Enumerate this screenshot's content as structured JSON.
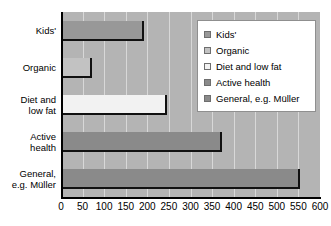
{
  "chart_data": {
    "type": "bar",
    "orientation": "horizontal",
    "title": "",
    "xlabel": "",
    "ylabel": "",
    "categories": [
      "Kids'",
      "Diet and low fat",
      "Organic",
      "Active health",
      "General, e.g. Müller"
    ],
    "axis_categories": [
      "Kids'",
      "Organic",
      "Diet and low fat",
      "Active health",
      "General, e.g. Müller"
    ],
    "values": [
      193,
      72,
      246,
      372,
      553
    ],
    "xlim": [
      0,
      600
    ],
    "xticks": [
      0,
      50,
      100,
      150,
      200,
      250,
      300,
      350,
      400,
      450,
      500,
      550,
      600
    ],
    "xtick_labels": [
      "0",
      "50",
      "100",
      "150",
      "200",
      "250",
      "300",
      "350",
      "400",
      "450",
      "500",
      "550",
      "600"
    ],
    "grid": true,
    "legend_position": "top-right",
    "bars": [
      {
        "label": "Kids'",
        "label_lines": "Kids'",
        "value": 193,
        "color": "#989898"
      },
      {
        "label": "Organic",
        "label_lines": "Organic",
        "value": 72,
        "color": "#c2c2c2"
      },
      {
        "label": "Diet and low fat",
        "label_lines": "Diet and\nlow fat",
        "value": 246,
        "color": "#f2f2f2"
      },
      {
        "label": "Active health",
        "label_lines": "Active\nhealth",
        "value": 372,
        "color": "#8a8a8a"
      },
      {
        "label": "General, e.g. Müller",
        "label_lines": "General,\ne.g. Müller",
        "value": 553,
        "color": "#8a8a8a"
      }
    ],
    "legend": [
      {
        "label": "Kids'",
        "color": "#989898"
      },
      {
        "label": "Organic",
        "color": "#c2c2c2"
      },
      {
        "label": "Diet and low fat",
        "color": "#f2f2f2"
      },
      {
        "label": "Active health",
        "color": "#8a8a8a"
      },
      {
        "label": "General, e.g. Müller",
        "color": "#8a8a8a"
      }
    ],
    "plot_background_color": "#b4b4b4",
    "gridline_color": "#d8d8d8",
    "axis_color": "#000000",
    "bar_outline_color": "#111111",
    "legend_background_color": "#ffffff",
    "legend_border_color": "#8f8f8f"
  }
}
